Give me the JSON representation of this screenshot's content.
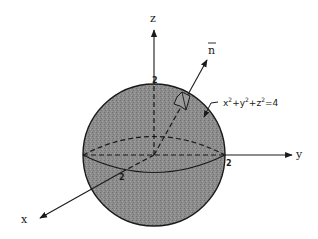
{
  "figure": {
    "axes": {
      "x_label": "x",
      "y_label": "y",
      "z_label": "z"
    },
    "intercepts": {
      "x": "2",
      "y": "2",
      "z": "2"
    },
    "normal_label": "n",
    "surface_label": {
      "x": "x",
      "y": "y",
      "z": "z",
      "exp": "2",
      "plus": "+",
      "rhs": "=4"
    },
    "colors": {
      "sphere_fill": "#8a8a8a",
      "line": "#1a1a1a",
      "background": "#ffffff"
    }
  }
}
